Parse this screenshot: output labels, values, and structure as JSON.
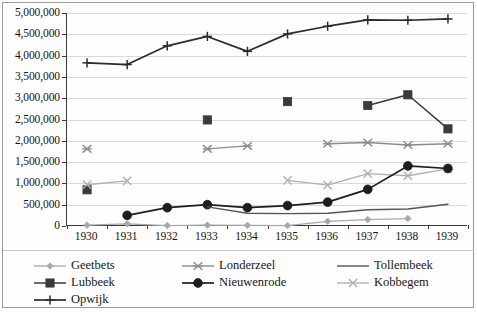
{
  "chart_data": {
    "type": "line",
    "title": "",
    "subtitle": "",
    "xlabel": "",
    "ylabel": "",
    "x": [
      1930,
      1931,
      1932,
      1933,
      1934,
      1935,
      1936,
      1937,
      1938,
      1939
    ],
    "xtick_labels": [
      "1930",
      "1931",
      "1932",
      "1933",
      "1934",
      "1935",
      "1936",
      "1937",
      "1938",
      "1939"
    ],
    "ylim": [
      0,
      5000000
    ],
    "ytick_values": [
      0,
      500000,
      1000000,
      1500000,
      2000000,
      2500000,
      3000000,
      3500000,
      4000000,
      4500000,
      5000000
    ],
    "ytick_labels": [
      "0",
      "500,000",
      "1,000,000",
      "1,500,000",
      "2,000,000",
      "2,500,000",
      "3,000,000",
      "3,500,000",
      "4,000,000",
      "4,500,000",
      "5,000,000"
    ],
    "grid": true,
    "grid_axis": "y",
    "legend_position": "bottom",
    "series": [
      {
        "name": "Geetbets",
        "marker": "diamond",
        "color": "#a8a8a8",
        "values": [
          20000,
          50000,
          10000,
          20000,
          15000,
          10000,
          110000,
          150000,
          175000,
          null
        ]
      },
      {
        "name": "Lubbeek",
        "marker": "square",
        "color": "#3a3a3a",
        "values": [
          850000,
          null,
          null,
          2490000,
          null,
          2920000,
          null,
          2830000,
          3080000,
          2280000
        ]
      },
      {
        "name": "Kobbegem",
        "marker": "cross-x",
        "color": "#b0b0b0",
        "values": [
          970000,
          1060000,
          null,
          null,
          null,
          1070000,
          960000,
          1230000,
          1180000,
          1340000
        ]
      },
      {
        "name": "Londerzeel",
        "marker": "asterisk",
        "color": "#8c8c8c",
        "values": [
          1810000,
          null,
          null,
          1810000,
          1880000,
          null,
          1930000,
          1960000,
          1900000,
          1930000
        ]
      },
      {
        "name": "Nieuwenrode",
        "marker": "circle",
        "color": "#1d1d1d",
        "values": [
          null,
          250000,
          430000,
          500000,
          430000,
          480000,
          560000,
          860000,
          1410000,
          1350000
        ]
      },
      {
        "name": "Opwijk",
        "marker": "plus",
        "color": "#2b2b2b",
        "values": [
          3830000,
          3790000,
          4230000,
          4450000,
          4100000,
          4510000,
          4690000,
          4840000,
          4830000,
          4860000
        ]
      },
      {
        "name": "Tollembeek",
        "marker": "none",
        "color": "#555555",
        "values": [
          null,
          null,
          null,
          450000,
          300000,
          290000,
          300000,
          380000,
          400000,
          510000
        ]
      }
    ]
  },
  "legend": {
    "entries": [
      {
        "label": "Geetbets",
        "order": 1
      },
      {
        "label": "Londerzeel",
        "order": 2
      },
      {
        "label": "Tollembeek",
        "order": 3
      },
      {
        "label": "Lubbeek",
        "order": 4
      },
      {
        "label": "Nieuwenrode",
        "order": 5
      },
      {
        "label": "Kobbegem",
        "order": 6
      },
      {
        "label": "Opwijk",
        "order": 7
      }
    ]
  }
}
